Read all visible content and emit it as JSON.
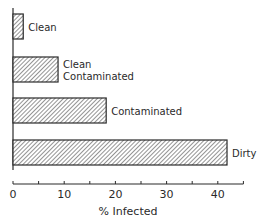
{
  "chart_data": {
    "type": "bar",
    "orientation": "horizontal",
    "title": "",
    "categories": [
      "Clean",
      "Clean Contaminated",
      "Contaminated",
      "Dirty"
    ],
    "category_label_lines": [
      [
        "Clean"
      ],
      [
        "Clean",
        "Contaminated"
      ],
      [
        "Contaminated"
      ],
      [
        "Dirty"
      ]
    ],
    "values": [
      2,
      8.8,
      18.2,
      41.8
    ],
    "xlabel": "% Infected",
    "ylabel": "",
    "xlim": [
      0,
      45
    ],
    "xticks_major": [
      0,
      10,
      20,
      30,
      40
    ],
    "xticks_minor": [
      5,
      15,
      25,
      35,
      45
    ],
    "grid": false,
    "legend": null,
    "bar_fill": "diagonal hatch",
    "colors": {
      "stroke": "#2a2a2a",
      "hatch": "#3a3a3a",
      "background": "#ffffff"
    }
  }
}
